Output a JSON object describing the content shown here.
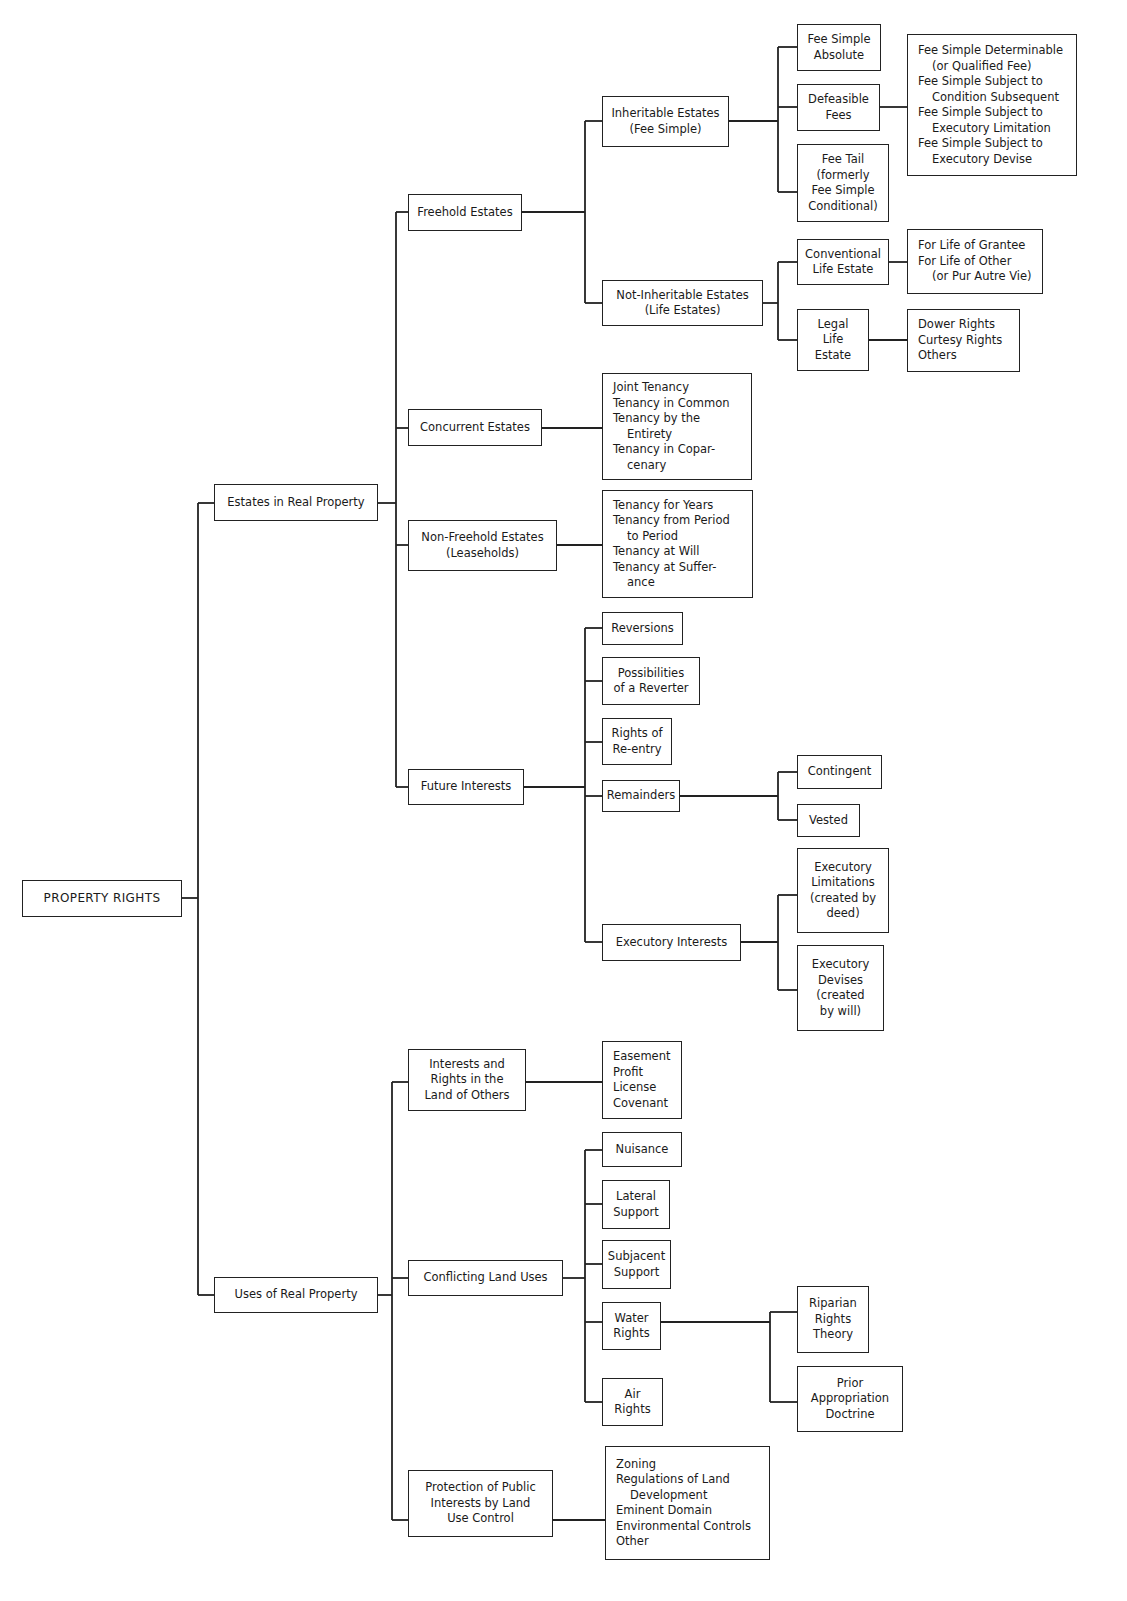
{
  "diagram": {
    "type": "hierarchy-tree",
    "root": "PROPERTY RIGHTS",
    "level1": {
      "estates": "Estates in Real Property",
      "uses": "Uses of Real Property"
    },
    "estates": {
      "freehold": "Freehold Estates",
      "concurrent": "Concurrent Estates",
      "nonfreehold": "Non-Freehold Estates\n(Leaseholds)",
      "future": "Future Interests"
    },
    "freehold": {
      "inheritable": "Inheritable Estates\n(Fee Simple)",
      "noninheritable": "Not-Inheritable Estates\n(Life Estates)"
    },
    "fee_simple": {
      "absolute": "Fee Simple\nAbsolute",
      "defeasible": "Defeasible\nFees",
      "fee_tail": "Fee Tail\n(formerly\nFee Simple\nConditional)"
    },
    "defeasible_list": [
      {
        "text": "Fee Simple Determinable",
        "indent": false
      },
      {
        "text": "(or Qualified Fee)",
        "indent": true
      },
      {
        "text": "Fee Simple Subject to",
        "indent": false
      },
      {
        "text": "Condition Subsequent",
        "indent": true
      },
      {
        "text": "Fee Simple Subject to",
        "indent": false
      },
      {
        "text": "Executory Limitation",
        "indent": true
      },
      {
        "text": "Fee Simple Subject to",
        "indent": false
      },
      {
        "text": "Executory Devise",
        "indent": true
      }
    ],
    "life_estates": {
      "conventional": "Conventional\nLife Estate",
      "legal": "Legal\nLife\nEstate"
    },
    "conventional_list": [
      {
        "text": "For Life of Grantee",
        "indent": false
      },
      {
        "text": "For Life of Other",
        "indent": false
      },
      {
        "text": "(or Pur Autre Vie)",
        "indent": true
      }
    ],
    "legal_list": [
      {
        "text": "Dower Rights",
        "indent": false
      },
      {
        "text": "Curtesy Rights",
        "indent": false
      },
      {
        "text": "Others",
        "indent": false
      }
    ],
    "concurrent_list": [
      {
        "text": "Joint Tenancy",
        "indent": false
      },
      {
        "text": "Tenancy in Common",
        "indent": false
      },
      {
        "text": "Tenancy by the",
        "indent": false
      },
      {
        "text": "Entirety",
        "indent": true
      },
      {
        "text": "Tenancy in Copar-",
        "indent": false
      },
      {
        "text": "cenary",
        "indent": true
      }
    ],
    "nonfreehold_list": [
      {
        "text": "Tenancy for Years",
        "indent": false
      },
      {
        "text": "Tenancy from Period",
        "indent": false
      },
      {
        "text": "to Period",
        "indent": true
      },
      {
        "text": "Tenancy at Will",
        "indent": false
      },
      {
        "text": "Tenancy at Suffer-",
        "indent": false
      },
      {
        "text": "ance",
        "indent": true
      }
    ],
    "future": {
      "reversions": "Reversions",
      "possibilities": "Possibilities\nof a Reverter",
      "reentry": "Rights of\nRe-entry",
      "remainders": "Remainders",
      "executory": "Executory Interests"
    },
    "remainders": {
      "contingent": "Contingent",
      "vested": "Vested"
    },
    "executory": {
      "limitations": "Executory\nLimitations\n(created by\ndeed)",
      "devises": "Executory\nDevises\n(created\nby will)"
    },
    "uses": {
      "interests": "Interests and\nRights in the\nLand of Others",
      "conflicting": "Conflicting Land Uses",
      "protection": "Protection of Public\nInterests by Land\nUse Control"
    },
    "interests_list": [
      {
        "text": "Easement",
        "indent": false
      },
      {
        "text": "Profit",
        "indent": false
      },
      {
        "text": "License",
        "indent": false
      },
      {
        "text": "Covenant",
        "indent": false
      }
    ],
    "conflicting": {
      "nuisance": "Nuisance",
      "lateral": "Lateral\nSupport",
      "subjacent": "Subjacent\nSupport",
      "water": "Water\nRights",
      "air": "Air\nRights"
    },
    "water": {
      "riparian": "Riparian\nRights\nTheory",
      "prior": "Prior\nAppropriation\nDoctrine"
    },
    "protection_list": [
      {
        "text": "Zoning",
        "indent": false
      },
      {
        "text": "Regulations of Land",
        "indent": false
      },
      {
        "text": "Development",
        "indent": true
      },
      {
        "text": "Eminent Domain",
        "indent": false
      },
      {
        "text": "Environmental Controls",
        "indent": false
      },
      {
        "text": "Other",
        "indent": false
      }
    ],
    "colors": {
      "line": "#222222",
      "background": "#ffffff",
      "text": "#1a1a1a"
    }
  }
}
